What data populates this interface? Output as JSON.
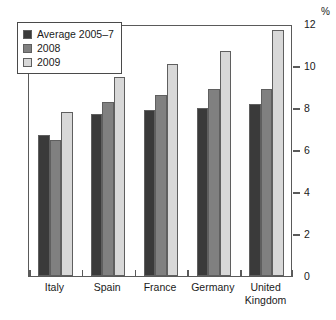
{
  "chart_data": {
    "type": "bar",
    "title": "",
    "xlabel": "",
    "ylabel": "%",
    "ylim": [
      0,
      12
    ],
    "yticks": [
      0,
      2,
      4,
      6,
      8,
      10,
      12
    ],
    "ytick_labels": [
      "0",
      "2",
      "4",
      "6",
      "8",
      "10",
      "12"
    ],
    "grid": false,
    "legend_position": "top-left",
    "categories": [
      "Italy",
      "Spain",
      "France",
      "Germany",
      "United\nKingdom"
    ],
    "series": [
      {
        "name": "Average 2005–7",
        "color": "#3a3a3a",
        "values": [
          6.7,
          7.7,
          7.9,
          8.0,
          8.2
        ]
      },
      {
        "name": "2008",
        "color": "#808080",
        "values": [
          6.5,
          8.3,
          8.6,
          8.9,
          8.9
        ]
      },
      {
        "name": "2009",
        "color": "#d8d8d8",
        "values": [
          7.8,
          9.5,
          10.1,
          10.7,
          11.7
        ]
      }
    ]
  },
  "axis": {
    "unit_label": "%",
    "frame_color": "#5a5a5a"
  }
}
